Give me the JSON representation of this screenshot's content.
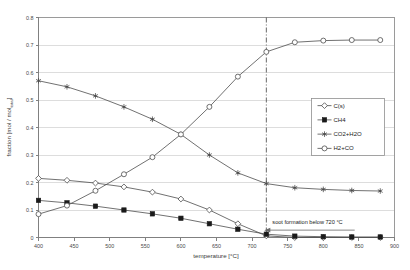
{
  "chart_data": {
    "type": "line",
    "title": "",
    "xlabel": "temperature [°C]",
    "ylabel": "fraction [mol / mol_total]",
    "xlim": [
      400,
      900
    ],
    "ylim": [
      0,
      0.8
    ],
    "xticks": [
      400,
      450,
      500,
      550,
      600,
      650,
      700,
      750,
      800,
      850,
      900
    ],
    "yticks": [
      0,
      0.1,
      0.2,
      0.3,
      0.4,
      0.5,
      0.6,
      0.7,
      0.8
    ],
    "xtick_labels": [
      "400",
      "450",
      "500",
      "550",
      "600",
      "650",
      "700",
      "750",
      "800",
      "850",
      "900"
    ],
    "ytick_labels": [
      "0",
      "0.1",
      "0.2",
      "0.3",
      "0.4",
      "0.5",
      "0.6",
      "0.7",
      "0.8"
    ],
    "grid": "horizontal",
    "legend_position": "right-middle",
    "x": [
      400,
      440,
      480,
      520,
      560,
      600,
      640,
      680,
      720,
      760,
      800,
      840,
      880
    ],
    "series": [
      {
        "name": "C(s)",
        "marker": "open-diamond",
        "values": [
          0.215,
          0.208,
          0.198,
          0.184,
          0.165,
          0.14,
          0.1,
          0.05,
          0.006,
          0.0,
          0.0,
          0.0,
          0.0
        ]
      },
      {
        "name": "CH4",
        "marker": "filled-square",
        "values": [
          0.135,
          0.126,
          0.114,
          0.1,
          0.086,
          0.07,
          0.05,
          0.03,
          0.012,
          0.005,
          0.003,
          0.002,
          0.002
        ]
      },
      {
        "name": "CO2+H2O",
        "marker": "star",
        "values": [
          0.57,
          0.548,
          0.515,
          0.475,
          0.43,
          0.375,
          0.3,
          0.235,
          0.196,
          0.181,
          0.175,
          0.171,
          0.169
        ]
      },
      {
        "name": "H2+CO",
        "marker": "open-circle",
        "values": [
          0.085,
          0.116,
          0.17,
          0.23,
          0.292,
          0.375,
          0.475,
          0.585,
          0.675,
          0.71,
          0.716,
          0.718,
          0.718
        ]
      }
    ],
    "annotations": [
      {
        "name": "soot-formation-note",
        "text": "soot formation below 720 °C",
        "x": 720,
        "y": 0.045,
        "arrow_direction": "left"
      }
    ],
    "reference_lines": [
      {
        "name": "soot-threshold-line",
        "orientation": "vertical",
        "x": 720,
        "style": "dash-dot"
      }
    ],
    "colors": {
      "line": "#4d4d4d",
      "marker_fill": "#1a1a1a",
      "grid": "#d4d4d4",
      "axis": "#808080",
      "background": "#ffffff"
    }
  },
  "legend": {
    "items": [
      {
        "label": "C(s)"
      },
      {
        "label": "CH4"
      },
      {
        "label": "CO2+H2O"
      },
      {
        "label": "H2+CO"
      }
    ]
  }
}
